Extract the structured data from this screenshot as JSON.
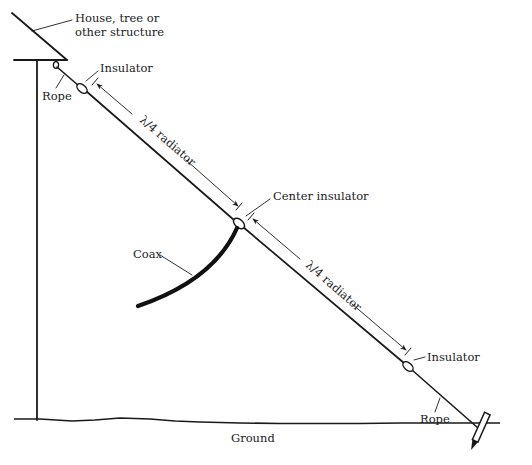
{
  "diagram": {
    "colors": {
      "ink": "#1a1a1a",
      "background": "#ffffff"
    },
    "labels": {
      "structure": [
        "House, tree or",
        "other structure"
      ],
      "rope_top": "Rope",
      "insulator_top": "Insulator",
      "radiator_upper": "λ/4 radiator",
      "center_insulator": "Center insulator",
      "coax": "Coax",
      "radiator_lower": "λ/4 radiator",
      "insulator_bottom": "Insulator",
      "rope_bottom": "Rope",
      "ground": "Ground"
    },
    "components": [
      {
        "name": "support structure",
        "icon": "roof-and-pole"
      },
      {
        "name": "rope (top)",
        "icon": "rope-line"
      },
      {
        "name": "end insulator (top)",
        "icon": "insulator"
      },
      {
        "name": "quarter-wave radiator (upper)",
        "icon": "wire"
      },
      {
        "name": "center insulator",
        "icon": "insulator"
      },
      {
        "name": "coax feed line",
        "icon": "coax-cable"
      },
      {
        "name": "quarter-wave radiator (lower)",
        "icon": "wire"
      },
      {
        "name": "end insulator (bottom)",
        "icon": "insulator"
      },
      {
        "name": "rope (bottom)",
        "icon": "rope-line"
      },
      {
        "name": "ground stake",
        "icon": "stake"
      },
      {
        "name": "ground line",
        "icon": "ground"
      }
    ]
  }
}
